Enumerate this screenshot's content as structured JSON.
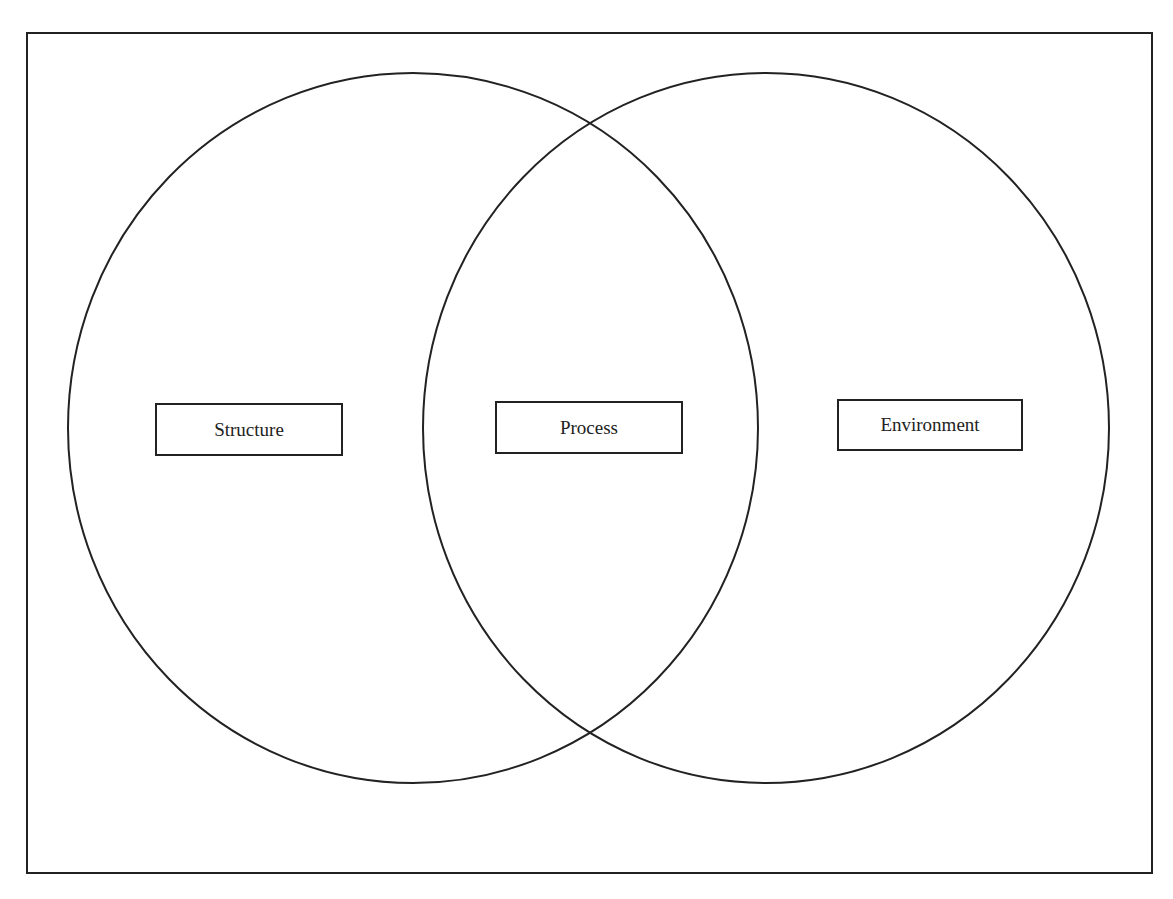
{
  "diagram": {
    "type": "venn",
    "sets": [
      {
        "id": "left",
        "label": "Structure"
      },
      {
        "id": "right",
        "label": "Environment"
      }
    ],
    "intersection": {
      "label": "Process"
    },
    "line_color": "#222222",
    "background": "#ffffff"
  }
}
